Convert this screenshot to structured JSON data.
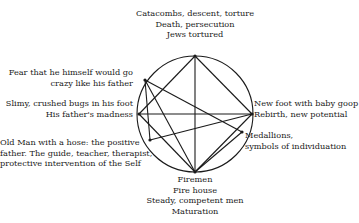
{
  "diagram": {
    "type": "circle-chord-diagram",
    "circle": {
      "cx": 195,
      "cy": 114,
      "r": 58,
      "stroke": "#1a1a1a"
    },
    "points": [
      {
        "id": "top",
        "x": 195,
        "y": 56
      },
      {
        "id": "fear",
        "x": 145,
        "y": 80
      },
      {
        "id": "slimy",
        "x": 139,
        "y": 114
      },
      {
        "id": "oldman",
        "x": 150,
        "y": 140
      },
      {
        "id": "bottom",
        "x": 195,
        "y": 172
      },
      {
        "id": "medallions",
        "x": 242,
        "y": 132
      },
      {
        "id": "right",
        "x": 252,
        "y": 114
      }
    ],
    "chords": [
      [
        "top",
        "bottom"
      ],
      [
        "top",
        "right"
      ],
      [
        "top",
        "slimy"
      ],
      [
        "slimy",
        "right"
      ],
      [
        "fear",
        "medallions"
      ],
      [
        "fear",
        "bottom"
      ],
      [
        "fear",
        "oldman"
      ],
      [
        "slimy",
        "bottom"
      ],
      [
        "oldman",
        "right"
      ],
      [
        "bottom",
        "medallions"
      ],
      [
        "bottom",
        "right"
      ]
    ]
  },
  "labels": {
    "top": [
      "Catacombs, descent, torture",
      "Death, persecution",
      "Jews tortured"
    ],
    "fear": [
      "Fear that he himself would go",
      "crazy like his father"
    ],
    "slimy": [
      "Slimy, crushed bugs in his foot",
      "His father's madness"
    ],
    "oldman": [
      "Old Man with a hose: the positive",
      "father. The guide, teacher, therapist,",
      "protective intervention of the Self"
    ],
    "bottom": [
      "Firemen",
      "Fire house",
      "Steady, competent men",
      "Maturation"
    ],
    "right": [
      "New foot with baby goop",
      "Rebirth, new potential"
    ],
    "medallions": [
      "Medallions,",
      "symbols of individuation"
    ]
  }
}
